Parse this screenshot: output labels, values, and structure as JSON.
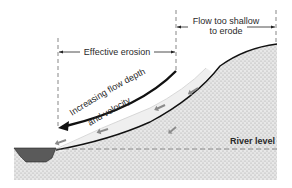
{
  "labels": {
    "effective_erosion": "Effective erosion",
    "flow_too_shallow_line1": "Flow too shallow",
    "flow_too_shallow_line2": "to erode",
    "increasing_line1": "Increasing flow depth",
    "increasing_line2": "and velocity",
    "river_level": "River level"
  },
  "colors": {
    "ground_stipple": "#bdbdbd",
    "ground_bg": "#e6e6e6",
    "flow_band": "#e9e9e9",
    "river_water": "#5a5a5a",
    "flow_arrow": "#8a8a8a",
    "outline": "#111111",
    "dash": "#777777"
  },
  "icons": {
    "flow_direction": "arrow-left-down",
    "main_arrow": "curved-arrow-left"
  }
}
